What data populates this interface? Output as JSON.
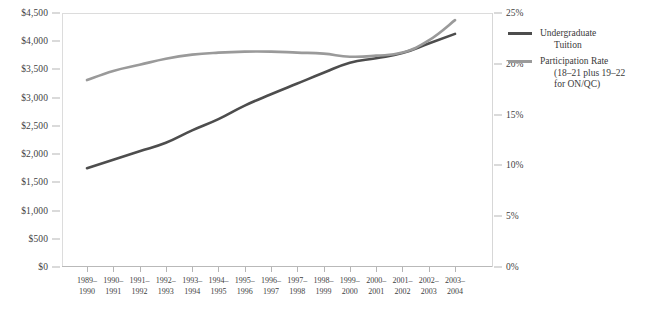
{
  "chart_data": {
    "type": "line",
    "title": "",
    "xlabel": "",
    "categories": [
      "1989–1990",
      "1990–1991",
      "1991–1992",
      "1992–1993",
      "1993–1994",
      "1994–1995",
      "1995–1996",
      "1996–1997",
      "1997–1998",
      "1998–1999",
      "1999–2000",
      "2000–2001",
      "2001–2002",
      "2002–2003",
      "2003–2004"
    ],
    "categories_lines": [
      [
        "1989–",
        "1990"
      ],
      [
        "1990–",
        "1991"
      ],
      [
        "1991–",
        "1992"
      ],
      [
        "1992–",
        "1993"
      ],
      [
        "1993–",
        "1994"
      ],
      [
        "1994–",
        "1995"
      ],
      [
        "1995–",
        "1996"
      ],
      [
        "1996–",
        "1997"
      ],
      [
        "1997–",
        "1998"
      ],
      [
        "1998–",
        "1999"
      ],
      [
        "1999–",
        "2000"
      ],
      [
        "2000–",
        "2001"
      ],
      [
        "2001–",
        "2002"
      ],
      [
        "2002–",
        "2003"
      ],
      [
        "2003–",
        "2004"
      ]
    ],
    "grid": false,
    "legend_position": "right",
    "axes": {
      "left": {
        "label": "",
        "ylim": [
          0,
          4500
        ],
        "ticks": [
          0,
          500,
          1000,
          1500,
          2000,
          2500,
          3000,
          3500,
          4000,
          4500
        ],
        "tick_labels": [
          "$0",
          "$500",
          "$1,000",
          "$1,500",
          "$2,000",
          "$2,500",
          "$3,000",
          "$3,500",
          "$4,000",
          "$4,500"
        ]
      },
      "right": {
        "label": "",
        "ylim": [
          0,
          25
        ],
        "ticks": [
          0,
          5,
          10,
          15,
          20,
          25
        ],
        "tick_labels": [
          "0%",
          "5%",
          "10%",
          "15%",
          "20%",
          "25%"
        ]
      }
    },
    "series": [
      {
        "name": "Undergraduate Tuition",
        "axis": "left",
        "color": "#4d4d4d",
        "unit": "dollars",
        "values": [
          1750,
          1900,
          2050,
          2200,
          2420,
          2620,
          2860,
          3060,
          3250,
          3440,
          3620,
          3700,
          3790,
          3960,
          4130
        ]
      },
      {
        "name": "Participation Rate",
        "axis": "right",
        "color": "#9a9a9a",
        "unit": "percent",
        "values": [
          18.4,
          19.3,
          19.9,
          20.5,
          20.9,
          21.1,
          21.2,
          21.2,
          21.1,
          21.0,
          20.7,
          20.8,
          21.1,
          22.3,
          24.3
        ]
      }
    ]
  },
  "legend": {
    "entries": [
      {
        "swatch_color": "#4d4d4d",
        "line1": "Undergraduate",
        "line2": "Tuition",
        "line3": ""
      },
      {
        "swatch_color": "#9a9a9a",
        "line1": "Participation Rate",
        "line2": "(18–21 plus 19–22",
        "line3": "for ON/QC)"
      }
    ]
  }
}
